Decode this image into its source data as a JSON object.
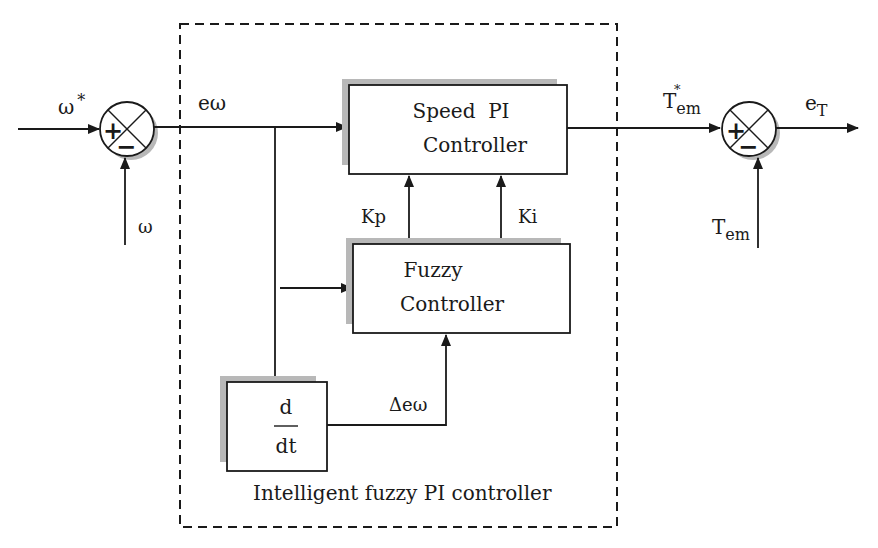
{
  "diagram": {
    "title": "Intelligent fuzzy PI controller",
    "type": "block-diagram",
    "container": {
      "label": "Intelligent fuzzy PI controller",
      "style": "dashed"
    },
    "blocks": {
      "speed_pi": {
        "line1": "Speed  PI",
        "line2": "Controller"
      },
      "fuzzy": {
        "line1": "Fuzzy",
        "line2": "Controller"
      },
      "derivative": {
        "numerator": "d",
        "denominator": "dt"
      }
    },
    "summing_junctions": {
      "speed_error": {
        "plus": "+",
        "minus": "−"
      },
      "torque_error": {
        "plus": "+",
        "minus": "−"
      }
    },
    "signals": {
      "omega_ref": {
        "base": "ω",
        "sup": "*"
      },
      "omega": {
        "base": "ω"
      },
      "e_omega": {
        "base": "eω"
      },
      "kp": {
        "base": "Kp"
      },
      "ki": {
        "base": "Ki"
      },
      "delta_e_omega": {
        "base": "Δeω"
      },
      "tem_ref": {
        "base": "T",
        "sub": "em",
        "sup": "*"
      },
      "tem": {
        "base": "T",
        "sub": "em"
      },
      "e_t": {
        "base": "e",
        "sub": "T"
      }
    },
    "colors": {
      "line": "#1a1a1a",
      "shadow": "#b8b8b8",
      "background": "#ffffff"
    }
  }
}
